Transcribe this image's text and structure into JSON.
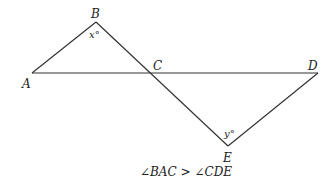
{
  "diagram": {
    "points": {
      "A": {
        "label": "A",
        "x": 32,
        "y": 73
      },
      "B": {
        "label": "B",
        "x": 96,
        "y": 22
      },
      "C": {
        "label": "C",
        "x": 151,
        "y": 73
      },
      "D": {
        "label": "D",
        "x": 318,
        "y": 73
      },
      "E": {
        "label": "E",
        "x": 228,
        "y": 146
      }
    },
    "angles": {
      "at_B": "x°",
      "at_E": "y°"
    },
    "caption": "∠BAC > ∠CDE",
    "line_color": "#333333"
  }
}
